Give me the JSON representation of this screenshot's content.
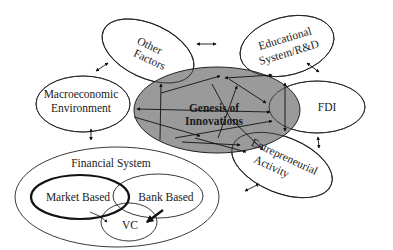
{
  "diagram": {
    "center": {
      "label_line1": "Genesis of",
      "label_line2": "Innovations",
      "fill": "#9a9a9a"
    },
    "nodes": {
      "other_factors": {
        "line1": "Other",
        "line2": "Factors"
      },
      "educational": {
        "line1": "Educational",
        "line2": "System/R&D"
      },
      "macroeconomic": {
        "line1": "Macroeconomic",
        "line2": "Environment"
      },
      "fdi": {
        "line1": "FDI"
      },
      "entrepreneurial": {
        "line1": "Entrepreneurial",
        "line2": "Activity"
      },
      "financial_system": {
        "label": "Financial System",
        "market_based": "Market Based",
        "bank_based": "Bank Based",
        "vc": "VC"
      }
    },
    "connections": [
      {
        "from": "Other Factors",
        "to": "Macroeconomic Environment",
        "type": "bidirectional"
      },
      {
        "from": "Other Factors",
        "to": "Educational System/R&D",
        "type": "bidirectional"
      },
      {
        "from": "Educational System/R&D",
        "to": "FDI",
        "type": "bidirectional"
      },
      {
        "from": "Macroeconomic Environment",
        "to": "Financial System",
        "type": "bidirectional"
      },
      {
        "from": "FDI",
        "to": "Entrepreneurial Activity",
        "type": "bidirectional"
      },
      {
        "from": "Financial System",
        "to": "Entrepreneurial Activity",
        "type": "bidirectional"
      },
      {
        "from": "Market Based",
        "to": "VC",
        "type": "directed"
      },
      {
        "from": "Bank Based",
        "to": "VC",
        "type": "directed-bold"
      }
    ]
  }
}
